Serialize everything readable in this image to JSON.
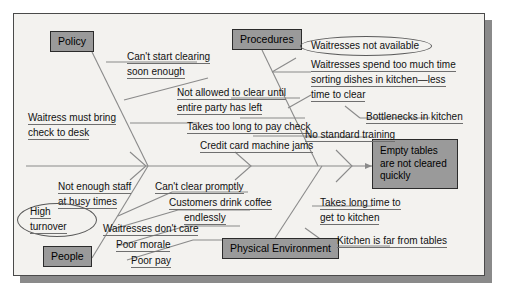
{
  "diagram": {
    "type": "fishbone-cause-and-effect",
    "effect": {
      "label": "Empty tables are not cleared quickly",
      "line1": "Empty tables",
      "line2": "are not cleared",
      "line3": "quickly"
    },
    "categories": [
      {
        "id": "policy",
        "label": "Policy",
        "position": "top-left"
      },
      {
        "id": "procedures",
        "label": "Procedures",
        "position": "top-right"
      },
      {
        "id": "people",
        "label": "People",
        "position": "bottom-left"
      },
      {
        "id": "physical-environment",
        "label": "Physical Environment",
        "position": "bottom-right"
      }
    ],
    "causes": {
      "policy": [
        {
          "id": "cant-start-clearing",
          "line1": "Can't start clearing",
          "line2": "soon enough"
        },
        {
          "id": "waitress-must-bring-check",
          "line1": "Waitress must bring",
          "line2": "check to desk"
        }
      ],
      "procedures": [
        {
          "id": "not-allowed-to-clear",
          "line1": "Not allowed to clear until",
          "line2": "entire party has left"
        },
        {
          "id": "takes-too-long-pay-check",
          "line1": "Takes too long to pay check",
          "line2": ""
        },
        {
          "id": "credit-card-machine-jams",
          "line1": "Credit card machine jams",
          "line2": ""
        },
        {
          "id": "waitresses-spend-too-much-time",
          "line1": "Waitresses spend too much time",
          "line2": "sorting dishes in kitchen—less",
          "line3": "time to clear"
        },
        {
          "id": "bottlenecks-in-kitchen",
          "line1": "Bottlenecks in kitchen",
          "line2": ""
        },
        {
          "id": "no-standard-training",
          "line1": "No standard training",
          "line2": ""
        }
      ],
      "people": [
        {
          "id": "not-enough-staff",
          "line1": "Not enough staff",
          "line2": "at busy times"
        },
        {
          "id": "waitresses-dont-care",
          "line1": "Waitresses don't care",
          "line2": ""
        },
        {
          "id": "poor-morale",
          "line1": "Poor morale",
          "line2": ""
        },
        {
          "id": "poor-pay",
          "line1": "Poor pay",
          "line2": ""
        },
        {
          "id": "cant-clear-promptly",
          "line1": "Can't clear promptly",
          "line2": ""
        },
        {
          "id": "customers-drink-coffee",
          "line1": "Customers drink coffee",
          "line2": "endlessly"
        }
      ],
      "physical_environment": [
        {
          "id": "takes-long-time-to-get-to-kitchen",
          "line1": "Takes long time to",
          "line2": "get to kitchen"
        },
        {
          "id": "kitchen-is-far-from-tables",
          "line1": "Kitchen is far from tables",
          "line2": ""
        }
      ]
    },
    "highlighted": [
      {
        "id": "waitresses-not-available",
        "label": "Waitresses not available",
        "shape": "oval"
      },
      {
        "id": "high-turnover",
        "line1": "High",
        "line2": "turnover",
        "shape": "oval"
      }
    ],
    "colors": {
      "box_fill": "#9a9a9a",
      "box_border": "#2b2b2b",
      "canvas": "#f3f2ef",
      "line": "#8a8a8a",
      "text": "#111111"
    }
  }
}
